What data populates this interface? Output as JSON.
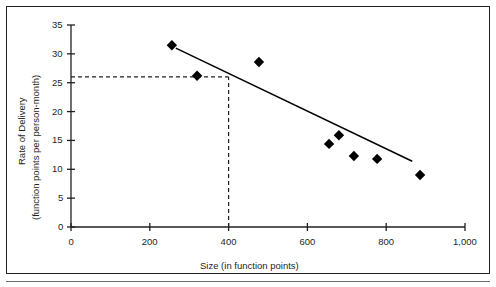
{
  "chart_data": {
    "type": "scatter",
    "title": "",
    "xlabel": "Size (in function points)",
    "ylabel_line1": "Rate of Delivery",
    "ylabel_line2": "(function points per person-month)",
    "xlim": [
      0,
      1000
    ],
    "ylim": [
      0,
      35
    ],
    "xticks": [
      0,
      200,
      400,
      600,
      800,
      1000
    ],
    "xtick_labels": [
      "0",
      "200",
      "400",
      "600",
      "800",
      "1,000"
    ],
    "yticks": [
      0,
      5,
      10,
      15,
      20,
      25,
      30,
      35
    ],
    "ytick_labels": [
      "0",
      "5",
      "10",
      "15",
      "20",
      "25",
      "30",
      "35"
    ],
    "grid": false,
    "legend": false,
    "marker": "diamond",
    "marker_color": "#000000",
    "points": [
      {
        "x": 256,
        "y": 31.5
      },
      {
        "x": 320,
        "y": 26.2
      },
      {
        "x": 477,
        "y": 28.6
      },
      {
        "x": 655,
        "y": 14.4
      },
      {
        "x": 680,
        "y": 15.9
      },
      {
        "x": 718,
        "y": 12.3
      },
      {
        "x": 777,
        "y": 11.8
      },
      {
        "x": 886,
        "y": 9.0
      }
    ],
    "trend_line": {
      "x_start": 266,
      "y_start": 31.0,
      "x_end": 866,
      "y_end": 11.4,
      "style": "solid",
      "color": "#000000"
    },
    "guide_lines": [
      {
        "orientation": "horizontal",
        "y": 26.0,
        "x_from": 0,
        "x_to": 400,
        "style": "dashed"
      },
      {
        "orientation": "vertical",
        "x": 400,
        "y_from": 0,
        "y_to": 26.0,
        "style": "dashed"
      }
    ],
    "axis_color": "#231f20",
    "background": "#ffffff"
  }
}
